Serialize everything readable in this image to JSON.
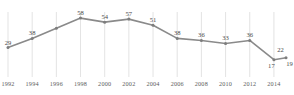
{
  "chart_data": {
    "type": "line",
    "title": "",
    "subtitle": "",
    "xlabel": "",
    "ylabel": "",
    "grid": "vertical",
    "legend": "none",
    "xlim": [
      1992,
      2015
    ],
    "ylim": [
      0,
      64
    ],
    "categories": [
      "1992",
      "1994",
      "1996",
      "1998",
      "2000",
      "2002",
      "2004",
      "2006",
      "2008",
      "2010",
      "2012",
      "2014",
      "2015"
    ],
    "tick_labels": [
      "1992",
      "1994",
      "1996",
      "1998",
      "2000",
      "2002",
      "2004",
      "2006",
      "2008",
      "2010",
      "2012",
      "2014"
    ],
    "x": [
      1992,
      1994,
      1996,
      1998,
      2000,
      2002,
      2004,
      2006,
      2008,
      2010,
      2012,
      2014,
      2015
    ],
    "values": [
      29,
      38,
      48,
      58,
      54,
      57,
      51,
      38,
      36,
      33,
      36,
      17,
      19
    ],
    "point_labels": [
      "29",
      "38",
      "",
      "58",
      "54",
      "57",
      "51",
      "38",
      "36",
      "33",
      "36",
      "17",
      "19"
    ],
    "extra_labels": [
      {
        "text": "22",
        "x": 2014.55,
        "y": 22
      }
    ],
    "series": [
      {
        "name": "series-1",
        "color": "#8a8a8a",
        "values": [
          29,
          38,
          48,
          58,
          54,
          57,
          51,
          38,
          36,
          33,
          36,
          17,
          19
        ]
      }
    ]
  },
  "style": {
    "line_color": "#8a8a8a",
    "marker_color": "#7d7d7d",
    "grid_color": "#dcdcdc",
    "label_color": "#4a4a4a",
    "tick_color": "#5d5d5d",
    "background": "#ffffff"
  }
}
